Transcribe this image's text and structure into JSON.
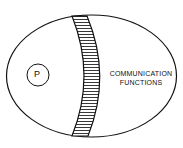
{
  "diagram": {
    "circle_label": "P",
    "region_label_line1": "COMMUNICATION",
    "region_label_line2": "FUNCTIONS"
  }
}
